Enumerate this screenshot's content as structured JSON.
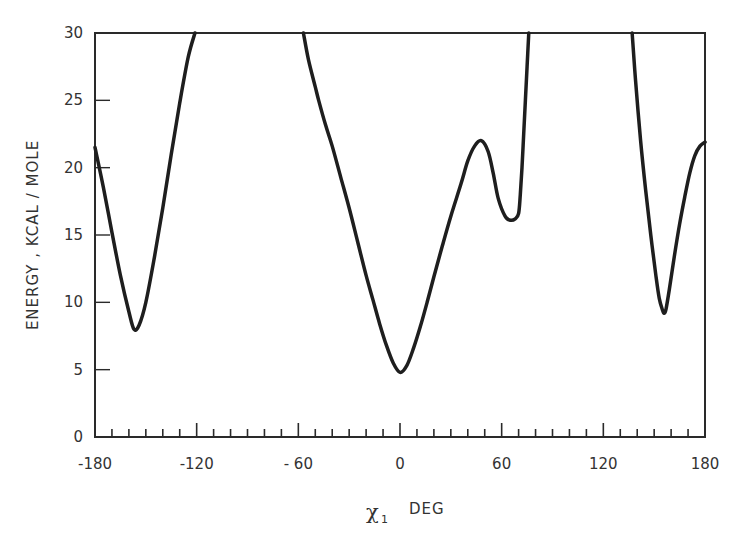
{
  "chart_data": {
    "type": "line",
    "title": "",
    "xlabel": "χ1 DEG",
    "xlabel_main": "χ",
    "xlabel_sub": "1",
    "xlabel_unit": "DEG",
    "ylabel": "ENERGY , KCAL / MOLE",
    "xlim": [
      -180,
      180
    ],
    "ylim": [
      0,
      30
    ],
    "xticks": [
      -180,
      -120,
      -60,
      0,
      60,
      120,
      180
    ],
    "xtick_labels": [
      "-180",
      "-120",
      "- 60",
      "0",
      "60",
      "120",
      "180"
    ],
    "xminor_step": 10,
    "yticks": [
      0,
      5,
      10,
      15,
      20,
      25,
      30
    ],
    "ytick_labels": [
      "0",
      "5",
      "10",
      "15",
      "20",
      "25",
      "30"
    ],
    "grid": false,
    "legend": null,
    "series": [
      {
        "name": "energy",
        "segments": [
          {
            "x": [
              -180,
              -175,
              -170,
              -165,
              -160,
              -157,
              -154,
              -150,
              -145,
              -140,
              -135,
              -130,
              -125,
              -121
            ],
            "y": [
              21.5,
              18.5,
              15.2,
              12.0,
              9.3,
              8.0,
              8.3,
              10.0,
              13.3,
              17.0,
              21.0,
              24.8,
              28.2,
              30
            ]
          },
          {
            "x": [
              -57,
              -54,
              -50,
              -48,
              -44,
              -40,
              -35,
              -30,
              -25,
              -20,
              -16,
              -12,
              -8,
              -4,
              0,
              4,
              8,
              12,
              16,
              20,
              25,
              30,
              36,
              40,
              44,
              48,
              52,
              55,
              58,
              62,
              65,
              68,
              70,
              71,
              72,
              73,
              74,
              75,
              76
            ],
            "y": [
              30,
              28.0,
              26.0,
              25.0,
              23.2,
              21.6,
              19.3,
              17.0,
              14.5,
              12.0,
              10.2,
              8.4,
              6.8,
              5.5,
              4.8,
              5.3,
              6.6,
              8.2,
              10.0,
              11.9,
              14.2,
              16.4,
              18.8,
              20.5,
              21.6,
              22.0,
              21.2,
              19.6,
              17.7,
              16.4,
              16.1,
              16.2,
              16.6,
              18,
              20,
              22.5,
              25,
              27.5,
              30
            ]
          },
          {
            "x": [
              137,
              139,
              142,
              145,
              148,
              151,
              153,
              155,
              156,
              157,
              159,
              162,
              165,
              168,
              171,
              174,
              177,
              180
            ],
            "y": [
              30,
              26.5,
              22.0,
              18.3,
              15.0,
              12.0,
              10.3,
              9.4,
              9.2,
              9.5,
              11.0,
              13.5,
              15.8,
              17.8,
              19.6,
              20.9,
              21.6,
              21.9
            ]
          }
        ]
      }
    ]
  }
}
